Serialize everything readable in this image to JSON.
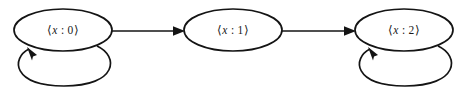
{
  "diagram": {
    "type": "state-transition-graph",
    "title": "",
    "background_color": "#ffffff",
    "stroke_color": "#141414",
    "text_color": "#1a1a1a",
    "nodes": [
      {
        "id": "state-0",
        "label": "⟨x : 0⟩",
        "label_open_bracket": "⟨",
        "label_variable": "x",
        "label_separator": " : ",
        "label_value": "0",
        "label_close_bracket": "⟩",
        "cx": 63,
        "cy": 30,
        "rx": 49,
        "ry": 21,
        "has_self_loop": true
      },
      {
        "id": "state-1",
        "label": "⟨x : 1⟩",
        "label_open_bracket": "⟨",
        "label_variable": "x",
        "label_separator": " : ",
        "label_value": "1",
        "label_close_bracket": "⟩",
        "cx": 233,
        "cy": 30,
        "rx": 49,
        "ry": 21,
        "has_self_loop": false
      },
      {
        "id": "state-2",
        "label": "⟨x : 2⟩",
        "label_open_bracket": "⟨",
        "label_variable": "x",
        "label_separator": " : ",
        "label_value": "2",
        "label_close_bracket": "⟩",
        "cx": 404,
        "cy": 30,
        "rx": 49,
        "ry": 21,
        "has_self_loop": true
      }
    ],
    "edges": [
      {
        "id": "edge-0-to-1",
        "from": "state-0",
        "to": "state-1",
        "label": "",
        "x1": 112,
        "y1": 31,
        "x2": 184,
        "y2": 31
      },
      {
        "id": "edge-1-to-2",
        "from": "state-1",
        "to": "state-2",
        "label": "",
        "x1": 282,
        "y1": 31,
        "x2": 355,
        "y2": 31
      }
    ],
    "self_loops": [
      {
        "id": "self-loop-state-0",
        "node": "state-0",
        "label": "",
        "path": "M 97 46 C 119 56 118 86 64 86 C 12 86 11 58 29 49",
        "arrow_tip_x": 27,
        "arrow_tip_y": 47,
        "arrow_angle_deg": -115
      },
      {
        "id": "self-loop-state-2",
        "node": "state-2",
        "label": "",
        "path": "M 438 46 C 460 56 459 86 405 86 C 353 86 352 58 370 49",
        "arrow_tip_x": 368,
        "arrow_tip_y": 47,
        "arrow_angle_deg": -115
      }
    ]
  }
}
